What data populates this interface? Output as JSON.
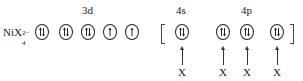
{
  "complex_label": {
    "base": "NiX",
    "sub": "4",
    "sup": "2−"
  },
  "groups": [
    {
      "label": "3d",
      "x": 88
    },
    {
      "label": "4s",
      "x": 182
    },
    {
      "label": "4p",
      "x": 247
    }
  ],
  "orbitals": [
    {
      "x": 42,
      "electrons": "paired"
    },
    {
      "x": 66,
      "electrons": "paired"
    },
    {
      "x": 88,
      "electrons": "paired"
    },
    {
      "x": 110,
      "electrons": "single"
    },
    {
      "x": 132,
      "electrons": "single"
    },
    {
      "x": 182,
      "electrons": "paired"
    },
    {
      "x": 223,
      "electrons": "paired"
    },
    {
      "x": 247,
      "electrons": "paired"
    },
    {
      "x": 277,
      "electrons": "paired"
    }
  ],
  "ligands": [
    {
      "label": "X",
      "x": 182
    },
    {
      "label": "X",
      "x": 223
    },
    {
      "label": "X",
      "x": 247
    },
    {
      "label": "X",
      "x": 277
    }
  ]
}
